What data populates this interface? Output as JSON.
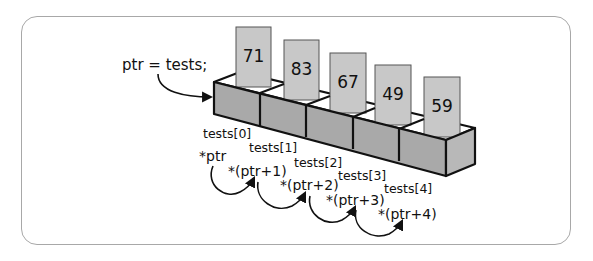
{
  "diagram": {
    "title_code": "ptr = tests;",
    "colors": {
      "front_face": "#a9a9a9",
      "side_face": "#b8b8b8",
      "top_face": "#ffffff",
      "card_fill": "#c8c8c8",
      "outline": "#111111",
      "frame_border": "#a8a8a8"
    },
    "elements": [
      {
        "value": "71",
        "index_label": "tests[0]",
        "pointer_expr": "*ptr"
      },
      {
        "value": "83",
        "index_label": "tests[1]",
        "pointer_expr": "*(ptr+1)"
      },
      {
        "value": "67",
        "index_label": "tests[2]",
        "pointer_expr": "*(ptr+2)"
      },
      {
        "value": "49",
        "index_label": "tests[3]",
        "pointer_expr": "*(ptr+3)"
      },
      {
        "value": "59",
        "index_label": "tests[4]",
        "pointer_expr": "*(ptr+4)"
      }
    ]
  }
}
